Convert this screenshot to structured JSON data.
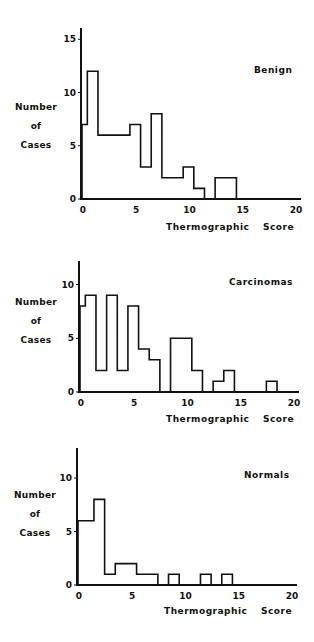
{
  "chart_data": [
    {
      "type": "bar",
      "style": "step-histogram",
      "title": "Benign",
      "xlabel": "Thermographic Score",
      "ylabel": "Number of Cases",
      "x": [
        0,
        1,
        2,
        3,
        4,
        5,
        6,
        7,
        8,
        9,
        10,
        11,
        12,
        13,
        14,
        15,
        16,
        17,
        18,
        19,
        20
      ],
      "values": [
        7,
        12,
        6,
        6,
        6,
        7,
        3,
        8,
        2,
        2,
        3,
        1,
        0,
        2,
        2,
        0,
        0,
        0,
        0,
        0,
        0
      ],
      "xticks": [
        0,
        5,
        10,
        15,
        20
      ],
      "yticks": [
        0,
        5,
        10,
        15
      ],
      "xlim": [
        0,
        20
      ],
      "ylim": [
        0,
        16
      ],
      "grid": false,
      "layout": {
        "x0": 82,
        "x20": 295,
        "y0": 199,
        "unit": 10.65,
        "ytop": 28
      }
    },
    {
      "type": "bar",
      "style": "step-histogram",
      "title": "Carcinomas",
      "xlabel": "Thermographic Score",
      "ylabel": "Number of Cases",
      "x": [
        0,
        1,
        2,
        3,
        4,
        5,
        6,
        7,
        8,
        9,
        10,
        11,
        12,
        13,
        14,
        15,
        16,
        17,
        18,
        19,
        20
      ],
      "values": [
        8,
        9,
        2,
        9,
        2,
        8,
        4,
        3,
        0,
        5,
        5,
        2,
        0,
        1,
        2,
        0,
        0,
        0,
        1,
        0,
        0
      ],
      "xticks": [
        0,
        5,
        10,
        15,
        20
      ],
      "yticks": [
        0,
        5,
        10
      ],
      "xlim": [
        0,
        20
      ],
      "ylim": [
        0,
        12
      ],
      "grid": false,
      "layout": {
        "x0": 80,
        "x20": 293,
        "y0": 392,
        "unit": 10.75,
        "ytop": 261
      }
    },
    {
      "type": "bar",
      "style": "step-histogram",
      "title": "Normals",
      "xlabel": "Thermographic Score",
      "ylabel": "Number of Cases",
      "x": [
        0,
        1,
        2,
        3,
        4,
        5,
        6,
        7,
        8,
        9,
        10,
        11,
        12,
        13,
        14,
        15,
        16,
        17,
        18,
        19,
        20
      ],
      "values": [
        6,
        6,
        8,
        1,
        2,
        2,
        1,
        1,
        0,
        1,
        0,
        0,
        1,
        0,
        1,
        0,
        0,
        0,
        0,
        0,
        0
      ],
      "xticks": [
        0,
        5,
        10,
        15,
        20
      ],
      "yticks": [
        0,
        5,
        10
      ],
      "xlim": [
        0,
        20
      ],
      "ylim": [
        0,
        12
      ],
      "grid": false,
      "layout": {
        "x0": 78,
        "x20": 291,
        "y0": 585,
        "unit": 10.7,
        "ytop": 448
      }
    }
  ],
  "panels": [
    {
      "title": "Benign",
      "ylabel_lines": [
        "Number",
        "of",
        "Cases"
      ],
      "xlabel": "Thermographic Score"
    },
    {
      "title": "Carcinomas",
      "ylabel_lines": [
        "Number",
        "of",
        "Cases"
      ],
      "xlabel": "Thermographic Score"
    },
    {
      "title": "Normals",
      "ylabel_lines": [
        "Number",
        "of",
        "Cases"
      ],
      "xlabel": "Thermographic Score"
    }
  ],
  "colors": {
    "ink": "#111111",
    "background": "#ffffff"
  }
}
